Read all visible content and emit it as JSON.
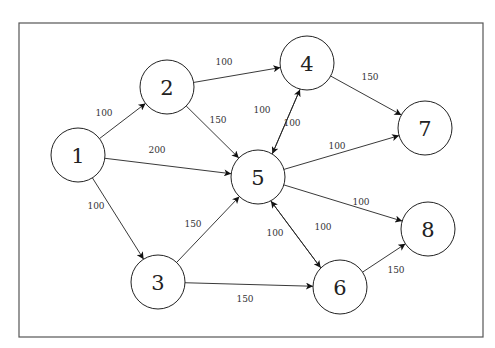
{
  "diagram": {
    "type": "directed-weighted-graph",
    "frame": {
      "x": 19,
      "y": 23,
      "width": 464,
      "height": 314
    },
    "node_radius": 27,
    "nodes": [
      {
        "id": "1",
        "label": "1",
        "x": 78,
        "y": 155
      },
      {
        "id": "2",
        "label": "2",
        "x": 167,
        "y": 87
      },
      {
        "id": "3",
        "label": "3",
        "x": 158,
        "y": 282
      },
      {
        "id": "4",
        "label": "4",
        "x": 307,
        "y": 63
      },
      {
        "id": "5",
        "label": "5",
        "x": 258,
        "y": 177
      },
      {
        "id": "6",
        "label": "6",
        "x": 340,
        "y": 287
      },
      {
        "id": "7",
        "label": "7",
        "x": 425,
        "y": 128
      },
      {
        "id": "8",
        "label": "8",
        "x": 428,
        "y": 229
      }
    ],
    "edges": [
      {
        "from": "1",
        "to": "2",
        "weight": "100",
        "lx": 104,
        "ly": 113,
        "offset": 0
      },
      {
        "from": "1",
        "to": "5",
        "weight": "200",
        "lx": 157,
        "ly": 150,
        "offset": 0
      },
      {
        "from": "1",
        "to": "3",
        "weight": "100",
        "lx": 96,
        "ly": 206,
        "offset": 0
      },
      {
        "from": "2",
        "to": "4",
        "weight": "100",
        "lx": 224,
        "ly": 62,
        "offset": 0
      },
      {
        "from": "2",
        "to": "5",
        "weight": "150",
        "lx": 218,
        "ly": 120,
        "offset": 0
      },
      {
        "from": "3",
        "to": "5",
        "weight": "150",
        "lx": 193,
        "ly": 224,
        "offset": 0
      },
      {
        "from": "3",
        "to": "6",
        "weight": "150",
        "lx": 245,
        "ly": 299,
        "offset": 0
      },
      {
        "from": "4",
        "to": "5",
        "weight": "100",
        "lx": 262,
        "ly": 110,
        "offset": -4
      },
      {
        "from": "5",
        "to": "4",
        "weight": "100",
        "lx": 292,
        "ly": 123,
        "offset": -4
      },
      {
        "from": "4",
        "to": "7",
        "weight": "150",
        "lx": 370,
        "ly": 77,
        "offset": 0
      },
      {
        "from": "5",
        "to": "7",
        "weight": "100",
        "lx": 337,
        "ly": 146,
        "offset": 0
      },
      {
        "from": "5",
        "to": "8",
        "weight": "100",
        "lx": 361,
        "ly": 202,
        "offset": 0
      },
      {
        "from": "5",
        "to": "6",
        "weight": "100",
        "lx": 275,
        "ly": 233,
        "offset": 4
      },
      {
        "from": "6",
        "to": "5",
        "weight": "100",
        "lx": 323,
        "ly": 227,
        "offset": 4
      },
      {
        "from": "6",
        "to": "8",
        "weight": "150",
        "lx": 396,
        "ly": 270,
        "offset": 0
      }
    ]
  }
}
